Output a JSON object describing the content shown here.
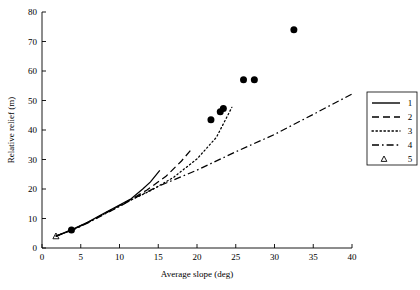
{
  "chart_data": {
    "type": "line",
    "title": "",
    "subtitle": "",
    "xlabel": "Average slope (deg)",
    "ylabel": "Relative relief  (m)",
    "xlim": [
      0,
      40
    ],
    "ylim": [
      0,
      80
    ],
    "xticks": [
      0,
      5,
      10,
      15,
      20,
      25,
      30,
      35,
      40
    ],
    "yticks": [
      0,
      10,
      20,
      30,
      40,
      50,
      60,
      70,
      80
    ],
    "xtick_labels": [
      "0",
      "5",
      "10",
      "15",
      "20",
      "25",
      "30",
      "35",
      "40"
    ],
    "ytick_labels": [
      "0",
      "10",
      "20",
      "30",
      "40",
      "50",
      "60",
      "70",
      "80"
    ],
    "grid": false,
    "legend_position": "right-outside",
    "legend_entries": [
      {
        "label": "1",
        "style": "solid"
      },
      {
        "label": "2",
        "style": "dashed"
      },
      {
        "label": "3",
        "style": "dotted"
      },
      {
        "label": "4",
        "style": "dashdot"
      },
      {
        "label": "5",
        "style": "marker-triangle"
      }
    ],
    "series": [
      {
        "name": "1",
        "style": "solid",
        "x": [
          1.8,
          4.0,
          6.0,
          8.0,
          10.0,
          11.5,
          13.0,
          14.0,
          15.2
        ],
        "y": [
          4.0,
          6.4,
          8.9,
          11.8,
          14.6,
          16.7,
          20.0,
          22.4,
          26.3
        ]
      },
      {
        "name": "2",
        "style": "dashed",
        "x": [
          1.8,
          4.0,
          6.0,
          8.0,
          10.0,
          11.5,
          13.5,
          16.0,
          18.0,
          19.4
        ],
        "y": [
          4.0,
          6.3,
          8.8,
          11.6,
          14.4,
          16.5,
          19.6,
          24.3,
          29.5,
          33.8
        ]
      },
      {
        "name": "3",
        "style": "dotted",
        "x": [
          1.8,
          4.0,
          6.0,
          8.0,
          10.0,
          11.5,
          14.0,
          17.0,
          20.0,
          22.5,
          24.5
        ],
        "y": [
          4.0,
          6.2,
          8.7,
          11.5,
          14.2,
          16.3,
          19.4,
          24.0,
          30.2,
          37.5,
          47.7
        ]
      },
      {
        "name": "4",
        "style": "dashdot",
        "x": [
          1.8,
          4.0,
          6.0,
          8.0,
          10.0,
          12.0,
          15.0,
          20.0,
          25.0,
          30.0,
          35.0,
          40.0
        ],
        "y": [
          4.0,
          6.2,
          8.6,
          11.4,
          14.1,
          17.0,
          20.9,
          26.4,
          32.6,
          38.5,
          45.3,
          52.2
        ]
      }
    ],
    "scatter": {
      "name": "data points",
      "marker": "filled-circle",
      "x": [
        3.8,
        21.8,
        23.0,
        23.4,
        26.0,
        27.4,
        32.5
      ],
      "y": [
        6.1,
        43.5,
        46.2,
        47.3,
        57.0,
        57.0,
        74.0
      ]
    },
    "triangle_marker": {
      "name": "5",
      "marker": "open-triangle",
      "x": [
        1.8
      ],
      "y": [
        4.0
      ]
    }
  },
  "colors": {
    "axis": "#000000",
    "line": "#000000",
    "marker": "#000000",
    "background": "#ffffff"
  }
}
